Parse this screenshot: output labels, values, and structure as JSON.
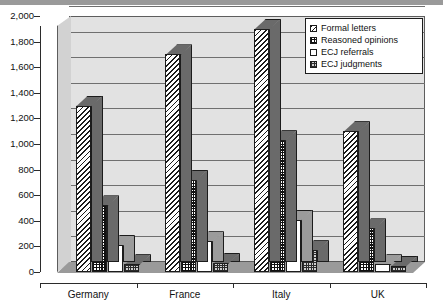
{
  "chart_data": {
    "type": "bar",
    "title": "",
    "subtitle": "",
    "xlabel": "",
    "ylabel": "",
    "categories": [
      "Germany",
      "France",
      "Italy",
      "UK"
    ],
    "series": [
      {
        "name": "Formal letters",
        "pattern": "diagonal-hatch",
        "values": [
          1300,
          1700,
          1900,
          1100
        ]
      },
      {
        "name": "Reasoned opinions",
        "pattern": "checkerboard",
        "values": [
          520,
          720,
          1030,
          340
        ]
      },
      {
        "name": "ECJ referrals",
        "pattern": "solid-white",
        "values": [
          210,
          240,
          410,
          60
        ]
      },
      {
        "name": "ECJ judgments",
        "pattern": "fine-grid",
        "values": [
          60,
          70,
          170,
          50
        ]
      }
    ],
    "ylim": [
      0,
      2000
    ],
    "ytick_step": 200,
    "ytick_labels": [
      "2,000",
      "1,800",
      "1,600",
      "1,400",
      "1,200",
      "1,000",
      "800",
      "600",
      "400",
      "200",
      "0"
    ],
    "ytick_values": [
      2000,
      1800,
      1600,
      1400,
      1200,
      1000,
      800,
      600,
      400,
      200,
      0
    ],
    "grid": true,
    "grid_axis": "y",
    "legend_position": "top-right",
    "style": "3d-column",
    "colors": {
      "plot_background": "#e2e2e2",
      "gridline": "#6f6f6f",
      "axis": "#2b2b2b",
      "floor": "#9a9a9a",
      "bar_outline": "#1c1c1c",
      "legend_background": "#ffffff"
    }
  },
  "legend": {
    "items": [
      {
        "label": "Formal letters"
      },
      {
        "label": "Reasoned opinions"
      },
      {
        "label": "ECJ referrals"
      },
      {
        "label": "ECJ judgments"
      }
    ]
  },
  "axis": {
    "y_labels": [
      "2,000",
      "1,800",
      "1,600",
      "1,400",
      "1,200",
      "1,000",
      "800",
      "600",
      "400",
      "200",
      "0"
    ],
    "x_labels": [
      "Germany",
      "France",
      "Italy",
      "UK"
    ]
  }
}
